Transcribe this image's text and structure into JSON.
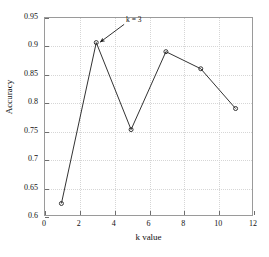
{
  "chart_data": {
    "type": "line",
    "title": "",
    "xlabel": "k value",
    "ylabel": "Accuracy",
    "xlim": [
      0,
      12
    ],
    "ylim": [
      0.6,
      0.95
    ],
    "grid": true,
    "legend": "none",
    "xticks": [
      "0",
      "2",
      "4",
      "6",
      "8",
      "10",
      "12"
    ],
    "xtick_values": [
      0,
      2,
      4,
      6,
      8,
      10,
      12
    ],
    "yticks": [
      "0.6",
      "0.65",
      "0.7",
      "0.75",
      "0.8",
      "0.85",
      "0.9",
      "0.95"
    ],
    "ytick_values": [
      0.6,
      0.65,
      0.7,
      0.75,
      0.8,
      0.85,
      0.9,
      0.95
    ],
    "x": [
      1,
      3,
      5,
      7,
      9,
      11
    ],
    "values": [
      0.622,
      0.905,
      0.752,
      0.889,
      0.859,
      0.789
    ],
    "series": [
      {
        "name": "Accuracy",
        "x": [
          1,
          3,
          5,
          7,
          9,
          11
        ],
        "values": [
          0.622,
          0.905,
          0.752,
          0.889,
          0.859,
          0.789
        ],
        "color": "#333333",
        "marker": "circle-open"
      }
    ],
    "annotations": [
      {
        "text": "k = 3",
        "target_x": 3,
        "target_y": 0.905,
        "label_x": 4.6,
        "label_y": 0.937
      }
    ]
  }
}
